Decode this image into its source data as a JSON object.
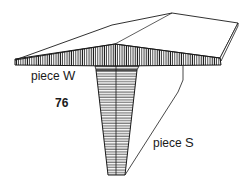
{
  "figure": {
    "number": "76",
    "labels": {
      "piece_w": {
        "prefix": "piece",
        "letter": "W"
      },
      "piece_s": {
        "prefix": "piece",
        "letter": "S"
      }
    },
    "colors": {
      "ink": "#1a1a1a",
      "background": "#ffffff"
    },
    "parts": [
      {
        "id": "piece-w",
        "description": "wide board with tapered (sliding dovetail) groove, end grain hatched vertically"
      },
      {
        "id": "piece-s",
        "description": "tapered tongue/post fitting into underside of board, horizontal hatching"
      }
    ]
  }
}
